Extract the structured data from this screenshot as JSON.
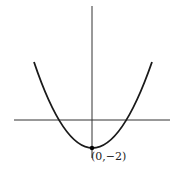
{
  "diagram": {
    "type": "parabola-graph",
    "function": "y = x^2 - 2",
    "vertex_label": "(0,−2)",
    "colors": {
      "curve": "#1a1a1a",
      "axes": "#333333",
      "point": "#000000"
    }
  }
}
